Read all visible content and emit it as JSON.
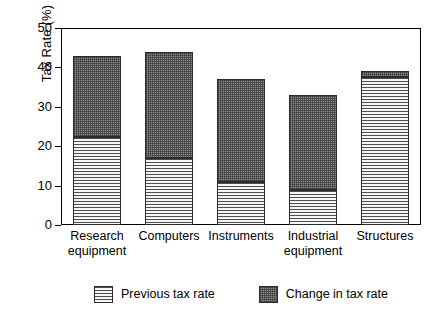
{
  "chart_data": {
    "type": "bar",
    "stacked": true,
    "title": "",
    "xlabel": "",
    "ylabel": "Tax Rate (%)",
    "ylim": [
      0,
      50
    ],
    "yticks": [
      0,
      10,
      20,
      30,
      40,
      50
    ],
    "ytick_labels": [
      "0",
      "10",
      "20",
      "30",
      "40",
      "50"
    ],
    "grid": false,
    "legend_position": "bottom",
    "categories": [
      "Research equipment",
      "Computers",
      "Instruments",
      "Industrial equipment",
      "Structures"
    ],
    "category_lines": [
      [
        "Research",
        "equipment"
      ],
      [
        "Computers",
        ""
      ],
      [
        "Instruments",
        ""
      ],
      [
        "Industrial",
        "equipment"
      ],
      [
        "Structures",
        ""
      ]
    ],
    "series": [
      {
        "name": "Previous tax rate",
        "pattern": "horizontal-lines",
        "color": "#f2f2f2",
        "values": [
          22.3,
          17.0,
          10.8,
          9.0,
          37.5
        ]
      },
      {
        "name": "Change in tax rate",
        "pattern": "checker-dark",
        "color": "#8c8c8c",
        "values": [
          20.7,
          27.0,
          26.2,
          24.0,
          1.5
        ]
      }
    ],
    "totals": [
      43.0,
      44.0,
      37.0,
      33.0,
      39.0
    ]
  },
  "legend": {
    "items": [
      {
        "label": "Previous tax rate"
      },
      {
        "label": "Change in tax rate"
      }
    ]
  }
}
